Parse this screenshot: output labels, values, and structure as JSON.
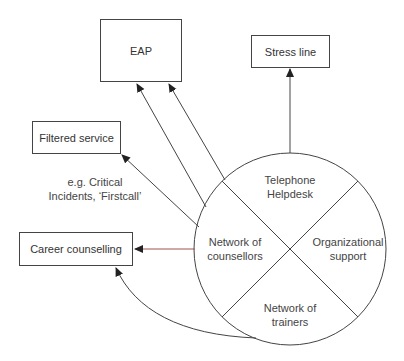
{
  "diagram": {
    "boxes": {
      "eap": "EAP",
      "stress_line": "Stress line",
      "filtered_service": "Filtered service",
      "career_counselling": "Career counselling"
    },
    "annotation": {
      "line1": "e.g. Critical",
      "line2": "Incidents, ‘Firstcall’"
    },
    "circle_segments": {
      "top": {
        "line1": "Telephone",
        "line2": "Helpdesk"
      },
      "left": {
        "line1": "Network of",
        "line2": "counsellors"
      },
      "right": {
        "line1": "Organizational",
        "line2": "support"
      },
      "bottom": {
        "line1": "Network of",
        "line2": "trainers"
      }
    },
    "colors": {
      "line": "#444444",
      "highlight_arrow": "#a05050"
    }
  }
}
